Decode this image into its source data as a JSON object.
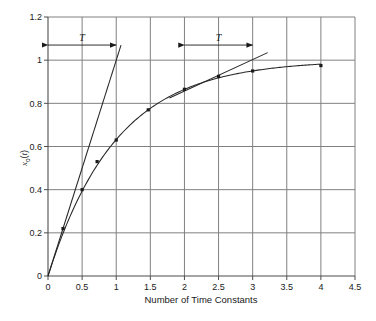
{
  "chart_data": {
    "type": "line",
    "title": "",
    "xlabel": "Number of Time Constants",
    "ylabel": "xₒ(t)",
    "xlim": [
      0,
      4.5
    ],
    "ylim": [
      0,
      1.2
    ],
    "grid": true,
    "legend": "none",
    "xticks": [
      "0",
      "0.5",
      "1",
      "1.5",
      "2",
      "2.5",
      "3",
      "3.5",
      "4",
      "4.5"
    ],
    "xtick_values": [
      0,
      0.5,
      1,
      1.5,
      2,
      2.5,
      3,
      3.5,
      4,
      4.5
    ],
    "yticks": [
      "0",
      "0.2",
      "0.4",
      "0.6",
      "0.8",
      "1",
      "1.2"
    ],
    "ytick_values": [
      0,
      0.2,
      0.4,
      0.6,
      0.8,
      1,
      1.2
    ],
    "series": [
      {
        "name": "step-response",
        "kind": "curve-with-markers",
        "equation": "1 - exp(-t)",
        "x": [
          0,
          0.22,
          0.5,
          0.72,
          1.0,
          1.47,
          2.0,
          2.5,
          3.0,
          4.0
        ],
        "values": [
          0.0,
          0.22,
          0.4,
          0.53,
          0.63,
          0.77,
          0.865,
          0.925,
          0.95,
          0.975
        ]
      },
      {
        "name": "tangent-at-origin",
        "kind": "straight-line",
        "x": [
          0,
          1.07
        ],
        "values": [
          0.0,
          1.07
        ]
      },
      {
        "name": "tangent-at-two",
        "kind": "straight-line",
        "x": [
          1.78,
          3.22
        ],
        "values": [
          0.825,
          1.035
        ]
      }
    ],
    "annotations": [
      {
        "label": "T",
        "x_start": 0,
        "x_end": 1,
        "y": 1.07,
        "style": "double-arrow"
      },
      {
        "label": "T",
        "x_start": 2,
        "x_end": 3,
        "y": 1.07,
        "style": "double-arrow"
      }
    ],
    "colors": {
      "grid": "#808080",
      "axis": "#4d4d4d",
      "curve": "#262626",
      "tangent": "#262626",
      "marker": "#1a1a1a",
      "background": "#ffffff"
    }
  }
}
